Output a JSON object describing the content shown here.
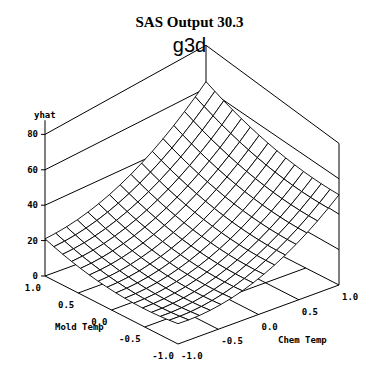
{
  "header": {
    "title": "SAS Output 30.3",
    "subtitle": "g3d"
  },
  "chart_data": {
    "type": "surface3d",
    "title": "SAS Output 30.3",
    "subtitle": "g3d",
    "zlabel": "yhat",
    "xlabel": "Mold Temp",
    "ylabel": "Chem Temp",
    "z_ticks": [
      "0",
      "20",
      "40",
      "60",
      "80"
    ],
    "x_ticks": [
      "1.0",
      "0.5",
      "0.0",
      "-0.5",
      "-1.0"
    ],
    "y_ticks": [
      "-1.0",
      "-0.5",
      "0.0",
      "0.5",
      "1.0"
    ],
    "zlim": [
      0,
      80
    ],
    "xlim": [
      -1,
      1
    ],
    "ylim": [
      -1,
      1
    ],
    "grid_lines": 15,
    "corner_values": {
      "mold_1_chem_-1": 25,
      "mold_1_chem_1": 80,
      "mold_-1_chem_1": 55,
      "mold_-1_chem_-1": 15
    },
    "model": {
      "a": 24,
      "b": 8.75,
      "c": 23.75,
      "d": 5,
      "e": 11,
      "f": 4
    }
  }
}
